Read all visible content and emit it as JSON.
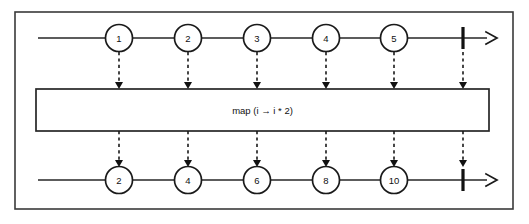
{
  "diagram": {
    "type": "marble-diagram",
    "colors": {
      "background": "#ffffff",
      "stroke": "#1a1a1a",
      "frame_stroke": "#3a3a3a",
      "marble_fill": "#ffffff"
    },
    "frame": {
      "x": 15,
      "y": 12,
      "width": 498,
      "height": 197
    },
    "operator_box": {
      "label": "map (i → i * 2)",
      "x": 36,
      "y": 89,
      "width": 453,
      "height": 42
    },
    "source_stream": {
      "name": "source-timeline",
      "y": 38,
      "line_start_x": 38,
      "line_end_x": 497,
      "completion_bar_x": 463,
      "marbles": [
        {
          "label": "1",
          "cx": 119,
          "r": 13.5
        },
        {
          "label": "2",
          "cx": 188,
          "r": 13.5
        },
        {
          "label": "3",
          "cx": 257,
          "r": 13.5
        },
        {
          "label": "4",
          "cx": 326,
          "r": 13.5
        },
        {
          "label": "5",
          "cx": 394,
          "r": 13.5
        }
      ]
    },
    "result_stream": {
      "name": "result-timeline",
      "y": 180,
      "line_start_x": 38,
      "line_end_x": 497,
      "completion_bar_x": 463,
      "marbles": [
        {
          "label": "2",
          "cx": 119,
          "r": 13.5
        },
        {
          "label": "4",
          "cx": 188,
          "r": 13.5
        },
        {
          "label": "6",
          "cx": 257,
          "r": 13.5
        },
        {
          "label": "8",
          "cx": 326,
          "r": 13.5
        },
        {
          "label": "10",
          "cx": 394,
          "r": 13.5
        }
      ]
    },
    "links_into_operator": [
      {
        "x": 119
      },
      {
        "x": 188
      },
      {
        "x": 257
      },
      {
        "x": 326
      },
      {
        "x": 394
      },
      {
        "x": 463
      }
    ],
    "links_out_of_operator": [
      {
        "x": 119
      },
      {
        "x": 188
      },
      {
        "x": 257
      },
      {
        "x": 326
      },
      {
        "x": 394
      },
      {
        "x": 463
      }
    ]
  }
}
